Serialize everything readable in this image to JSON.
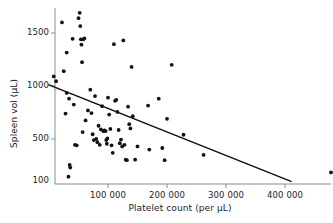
{
  "chart_data": {
    "type": "scatter",
    "title": "",
    "xlabel": "Platelet count (per µL)",
    "ylabel": "Spleen vol (µL)",
    "xlim": [
      0,
      500000
    ],
    "ylim": [
      100,
      1750
    ],
    "grid": false,
    "legend": null,
    "xticks": [
      100000,
      200000,
      300000,
      400000
    ],
    "xticklabels": [
      "100 000",
      "200 000",
      "300 000",
      "400 000"
    ],
    "yticks": [
      100,
      500,
      1000,
      1500
    ],
    "yticklabels": [
      "100",
      "500",
      "1000",
      "1500"
    ],
    "marker": "filled-circle",
    "marker_color": "#121212",
    "axis_color": "#8c8c8c",
    "fit_line": {
      "type": "linear-regression",
      "color": "#0f0f0f",
      "x_start": 0,
      "y_start": 1010,
      "x_end": 410000,
      "y_end": 100
    },
    "points": [
      [
        8000,
        1090
      ],
      [
        12000,
        1045
      ],
      [
        22000,
        1600
      ],
      [
        25000,
        1140
      ],
      [
        28000,
        740
      ],
      [
        30000,
        1315
      ],
      [
        30000,
        935
      ],
      [
        33000,
        145
      ],
      [
        34000,
        880
      ],
      [
        35000,
        255
      ],
      [
        36000,
        230
      ],
      [
        40000,
        1445
      ],
      [
        42000,
        825
      ],
      [
        44000,
        445
      ],
      [
        47000,
        440
      ],
      [
        50000,
        1640
      ],
      [
        52000,
        1690
      ],
      [
        53000,
        1565
      ],
      [
        54000,
        1440
      ],
      [
        55000,
        1390
      ],
      [
        56000,
        1225
      ],
      [
        57000,
        565
      ],
      [
        58000,
        1440
      ],
      [
        60000,
        1450
      ],
      [
        62000,
        675
      ],
      [
        66000,
        770
      ],
      [
        70000,
        965
      ],
      [
        72000,
        745
      ],
      [
        74000,
        545
      ],
      [
        76000,
        490
      ],
      [
        78000,
        905
      ],
      [
        80000,
        500
      ],
      [
        82000,
        470
      ],
      [
        84000,
        625
      ],
      [
        86000,
        445
      ],
      [
        88000,
        590
      ],
      [
        90000,
        810
      ],
      [
        92000,
        575
      ],
      [
        94000,
        580
      ],
      [
        96000,
        575
      ],
      [
        97000,
        490
      ],
      [
        98000,
        455
      ],
      [
        99000,
        505
      ],
      [
        100000,
        890
      ],
      [
        102000,
        730
      ],
      [
        104000,
        595
      ],
      [
        106000,
        440
      ],
      [
        108000,
        370
      ],
      [
        110000,
        1395
      ],
      [
        112000,
        860
      ],
      [
        114000,
        870
      ],
      [
        116000,
        755
      ],
      [
        118000,
        585
      ],
      [
        120000,
        460
      ],
      [
        122000,
        495
      ],
      [
        124000,
        430
      ],
      [
        126000,
        1430
      ],
      [
        128000,
        445
      ],
      [
        130000,
        305
      ],
      [
        132000,
        300
      ],
      [
        134000,
        805
      ],
      [
        136000,
        640
      ],
      [
        138000,
        600
      ],
      [
        140000,
        1180
      ],
      [
        142000,
        715
      ],
      [
        146000,
        305
      ],
      [
        150000,
        430
      ],
      [
        168000,
        815
      ],
      [
        170000,
        400
      ],
      [
        186000,
        880
      ],
      [
        192000,
        415
      ],
      [
        196000,
        300
      ],
      [
        200000,
        690
      ],
      [
        208000,
        1200
      ],
      [
        228000,
        540
      ],
      [
        262000,
        350
      ],
      [
        478000,
        185
      ]
    ]
  }
}
